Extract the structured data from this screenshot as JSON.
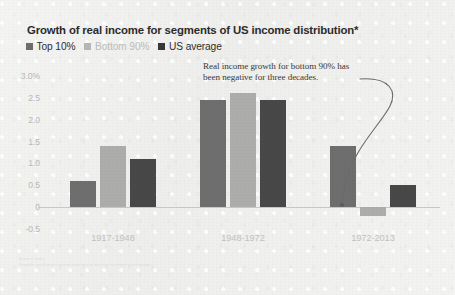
{
  "chart_data": {
    "type": "bar",
    "title": "Growth of real income for segments of US income distribution*",
    "xlabel": "",
    "ylabel": "",
    "categories": [
      "1917-1948",
      "1948-1972",
      "1972-2013"
    ],
    "series": [
      {
        "name": "Top 10%",
        "color": "#6e6e6e",
        "values": [
          0.6,
          2.45,
          1.4
        ]
      },
      {
        "name": "Bottom 90%",
        "color": "#adadab",
        "values": [
          1.4,
          2.6,
          -0.2
        ]
      },
      {
        "name": "US average",
        "color": "#484848",
        "values": [
          1.1,
          2.45,
          0.5
        ]
      }
    ],
    "ylim": [
      -0.5,
      3.0
    ],
    "yticks": [
      "3.0%",
      "2.5",
      "2.0",
      "1.5",
      "1.0",
      "0.5",
      "0",
      "-0.5"
    ],
    "ytick_values": [
      3.0,
      2.5,
      2.0,
      1.5,
      1.0,
      0.5,
      0,
      -0.5
    ],
    "grid": false,
    "legend_position": "top-left",
    "annotations": [
      {
        "text": "Real income growth for bottom 90% has been negative for three decades.",
        "points_to": "1972-2013 Bottom 90%"
      }
    ]
  },
  "legend": {
    "items": [
      {
        "label": "Top 10%",
        "color": "#6e6e6e",
        "text_color": "#2f2f2f"
      },
      {
        "label": "Bottom 90%",
        "color": "#b6b6b4",
        "text_color": "#bdbdbb"
      },
      {
        "label": "US average",
        "color": "#383838",
        "text_color": "#2f2f2f"
      }
    ]
  },
  "footnote": {
    "label": "Source notes",
    "text": "Illegible small print source note line at base of scanned chart image"
  }
}
